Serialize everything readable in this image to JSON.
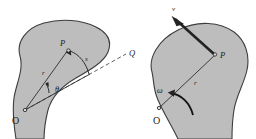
{
  "figure": {
    "caption": "",
    "background_color": "#ffffff",
    "body_fill_color": "#bdbdbd",
    "body_outline_color": "#3d3d3d",
    "ink_color": "#232323"
  },
  "left_diagram": {
    "name": "angular-displacement-diagram",
    "labels": {
      "origin": "O",
      "point_p": "P",
      "radius": "r",
      "angle": "θ",
      "arc_length": "s",
      "reference_point": "Q"
    }
  },
  "right_diagram": {
    "name": "angular-velocity-diagram",
    "labels": {
      "origin": "O",
      "point_p": "P",
      "radius": "r",
      "velocity": "v",
      "angular_velocity": "ω"
    }
  }
}
